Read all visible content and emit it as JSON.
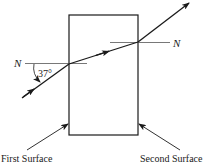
{
  "diagram": {
    "normal_left_label": "N",
    "normal_right_label": "N",
    "angle_label": "37°",
    "first_surface_label": "First Surface",
    "second_surface_label": "Second Surface"
  },
  "colors": {
    "line": "#1a1a1a",
    "background": "#ffffff"
  }
}
